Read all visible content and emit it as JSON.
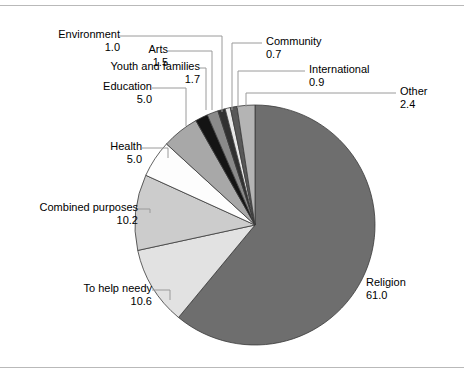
{
  "chart_data": {
    "type": "pie",
    "title": "",
    "subtitle": "",
    "xlabel": "",
    "ylabel": "",
    "legend_position": "callout-labels",
    "grid": false,
    "units": "percent",
    "start_angle_deg": 0,
    "direction": "clockwise",
    "categories": [
      "Religion",
      "To help needy",
      "Combined purposes",
      "Health",
      "Education",
      "Youth and families",
      "Arts",
      "Environment",
      "Community",
      "International",
      "Other"
    ],
    "values": [
      61.0,
      10.6,
      10.2,
      5.0,
      5.0,
      1.7,
      1.5,
      1.0,
      0.7,
      0.9,
      2.4
    ],
    "slices": [
      {
        "label": "Religion",
        "value": "61.0",
        "color": "#6e6e6e"
      },
      {
        "label": "To help needy",
        "value": "10.6",
        "color": "#e2e2e2"
      },
      {
        "label": "Combined purposes",
        "value": "10.2",
        "color": "#cccccc"
      },
      {
        "label": "Health",
        "value": "5.0",
        "color": "#fdfdfd"
      },
      {
        "label": "Education",
        "value": "5.0",
        "color": "#a8a8a8"
      },
      {
        "label": "Youth and families",
        "value": "1.7",
        "color": "#141414"
      },
      {
        "label": "Arts",
        "value": "1.5",
        "color": "#8a8a8a"
      },
      {
        "label": "Environment",
        "value": "1.0",
        "color": "#303030"
      },
      {
        "label": "Community",
        "value": "0.7",
        "color": "#e8e8e8"
      },
      {
        "label": "International",
        "value": "0.9",
        "color": "#585858"
      },
      {
        "label": "Other",
        "value": "2.4",
        "color": "#b4b4b4"
      }
    ]
  },
  "labels": {
    "environment": {
      "text": "Environment",
      "value": "1.0"
    },
    "arts": {
      "text": "Arts",
      "value": "1.5"
    },
    "youth_and_families": {
      "text": "Youth and families",
      "value": "1.7"
    },
    "education": {
      "text": "Education",
      "value": "5.0"
    },
    "health": {
      "text": "Health",
      "value": "5.0"
    },
    "combined_purposes": {
      "text": "Combined purposes",
      "value": "10.2"
    },
    "to_help_needy": {
      "text": "To help needy",
      "value": "10.6"
    },
    "religion": {
      "text": "Religion",
      "value": "61.0"
    },
    "community": {
      "text": "Community",
      "value": "0.7"
    },
    "international": {
      "text": "International",
      "value": "0.9"
    },
    "other": {
      "text": "Other",
      "value": "2.4"
    }
  },
  "style": {
    "slice_outline": "#3a3a3a",
    "leader_line": "#9a9a9a",
    "frame_rule": "#b9b9b9"
  }
}
